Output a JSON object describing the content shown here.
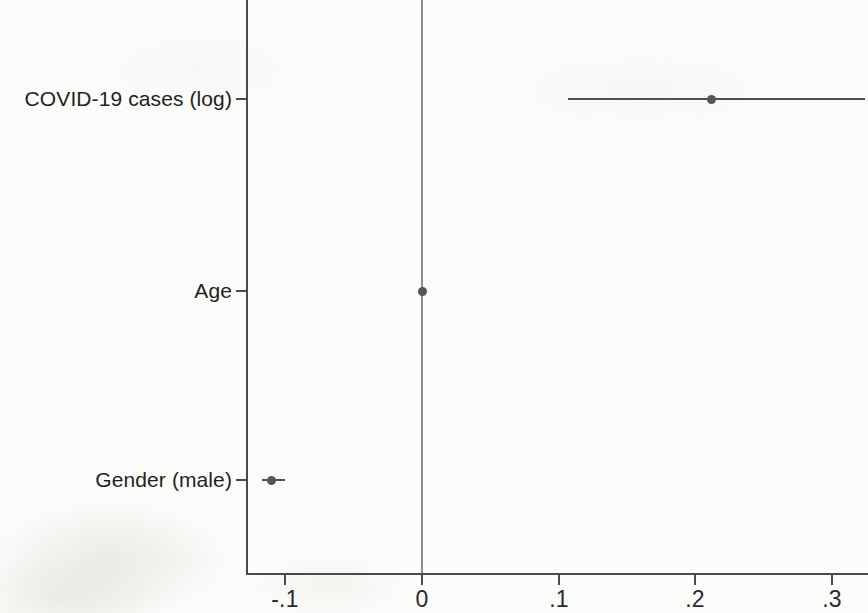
{
  "chart_data": {
    "type": "scatter",
    "subtype": "coefficient-plot-with-confidence-intervals",
    "title": "",
    "xlabel": "",
    "ylabel": "",
    "xlim": [
      -0.13,
      0.327
    ],
    "xticks": [
      -0.1,
      0,
      0.1,
      0.2,
      0.3
    ],
    "xtick_labels": [
      "-.1",
      "0",
      ".1",
      ".2",
      ".3"
    ],
    "categories": [
      "COVID-19 cases (log)",
      "Age",
      "Gender (male)"
    ],
    "grid": false,
    "legend": null,
    "reference_line": 0,
    "points": [
      {
        "label": "COVID-19 cases (log)",
        "estimate": 0.212,
        "ci_low": 0.107,
        "ci_high": 0.324,
        "ci_high_clipped": true
      },
      {
        "label": "Age",
        "estimate": 0.0,
        "ci_low": -0.002,
        "ci_high": 0.002,
        "ci_high_clipped": false
      },
      {
        "label": "Gender (male)",
        "estimate": -0.11,
        "ci_low": -0.117,
        "ci_high": -0.1,
        "ci_high_clipped": false
      }
    ],
    "colors": {
      "marker": "#555555",
      "ci": "#4f4f4f",
      "axis": "#4a4a4a",
      "reference_line": "#8e8e8e",
      "background": "#fcfcfa"
    }
  },
  "axis": {
    "x": {
      "ticks": [
        {
          "value": -0.1,
          "label": "-.1"
        },
        {
          "value": 0,
          "label": "0"
        },
        {
          "value": 0.1,
          "label": ".1"
        },
        {
          "value": 0.2,
          "label": ".2"
        },
        {
          "value": 0.3,
          "label": ".3"
        }
      ]
    },
    "y": {
      "ticks": [
        {
          "label": "COVID-19 cases (log)"
        },
        {
          "label": "Age"
        },
        {
          "label": "Gender (male)"
        }
      ]
    }
  }
}
